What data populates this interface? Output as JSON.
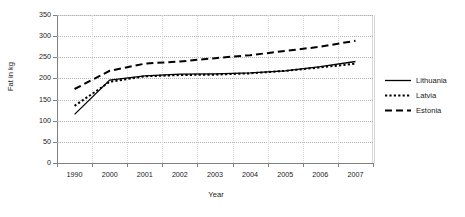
{
  "chart_data": {
    "type": "line",
    "title": "",
    "xlabel": "Year",
    "ylabel": "Fat in kg",
    "categories": [
      "1990",
      "2000",
      "2001",
      "2002",
      "2003",
      "2004",
      "2005",
      "2006",
      "2007"
    ],
    "ylim": [
      0,
      350
    ],
    "ytick_labels": [
      "0",
      "50",
      "100",
      "150",
      "200",
      "250",
      "300",
      "350"
    ],
    "yticks": [
      0,
      50,
      100,
      150,
      200,
      250,
      300,
      350
    ],
    "grid": true,
    "legend_position": "right",
    "series": [
      {
        "name": "Lithuania",
        "style": "solid",
        "values": [
          115,
          196,
          206,
          210,
          211,
          213,
          218,
          228,
          240
        ]
      },
      {
        "name": "Latvia",
        "style": "dotted",
        "values": [
          135,
          192,
          205,
          208,
          209,
          212,
          218,
          226,
          235
        ]
      },
      {
        "name": "Estonia",
        "style": "dashed",
        "values": [
          175,
          218,
          235,
          240,
          248,
          255,
          265,
          275,
          289
        ]
      }
    ]
  },
  "legend": {
    "items": [
      {
        "label": "Lithuania",
        "style": "solid"
      },
      {
        "label": "Latvia",
        "style": "dotted"
      },
      {
        "label": "Estonia",
        "style": "dashed"
      }
    ]
  }
}
